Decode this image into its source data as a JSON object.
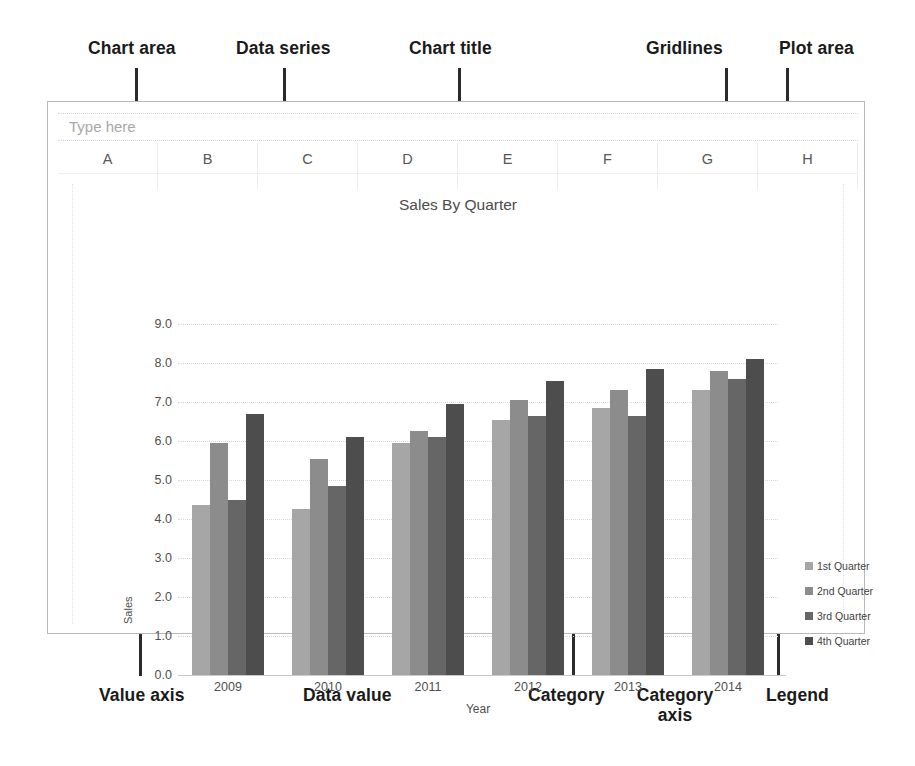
{
  "annotations": {
    "chart_area": "Chart area",
    "data_series": "Data series",
    "chart_title": "Chart title",
    "gridlines": "Gridlines",
    "plot_area": "Plot area",
    "value_axis": "Value axis",
    "data_value": "Data value",
    "category": "Category",
    "category_axis": "Category\naxis",
    "legend": "Legend"
  },
  "spreadsheet": {
    "type_here_placeholder": "Type here",
    "columns": [
      "A",
      "B",
      "C",
      "D",
      "E",
      "F",
      "G",
      "H"
    ]
  },
  "chart_data": {
    "type": "bar",
    "title": "Sales By Quarter",
    "xlabel": "Year",
    "ylabel": "Sales",
    "categories": [
      "2009",
      "2010",
      "2011",
      "2012",
      "2013",
      "2014"
    ],
    "ylim": [
      0.0,
      9.0
    ],
    "ytick_step": 1.0,
    "yticks": [
      "0.0",
      "1.0",
      "2.0",
      "3.0",
      "4.0",
      "5.0",
      "6.0",
      "7.0",
      "8.0",
      "9.0"
    ],
    "grid": true,
    "legend_position": "right",
    "series": [
      {
        "name": "1st Quarter",
        "color": "#a6a6a6",
        "values": [
          4.35,
          4.25,
          5.95,
          6.55,
          6.85,
          7.3
        ]
      },
      {
        "name": "2nd Quarter",
        "color": "#8c8c8c",
        "values": [
          5.95,
          5.55,
          6.25,
          7.05,
          7.3,
          7.8
        ]
      },
      {
        "name": "3rd Quarter",
        "color": "#666666",
        "values": [
          4.5,
          4.85,
          6.1,
          6.65,
          6.65,
          7.6
        ]
      },
      {
        "name": "4th Quarter",
        "color": "#4d4d4d",
        "values": [
          6.7,
          6.1,
          6.95,
          7.55,
          7.85,
          8.1
        ]
      }
    ]
  },
  "colors": {
    "leader_line": "#2b2b2b",
    "frame_border": "#b9b9b9",
    "gridline": "#d9d9d9",
    "axis_text": "#4f4f4f",
    "title_text": "#4c4c4c",
    "placeholder_text": "#a8a8a8"
  }
}
